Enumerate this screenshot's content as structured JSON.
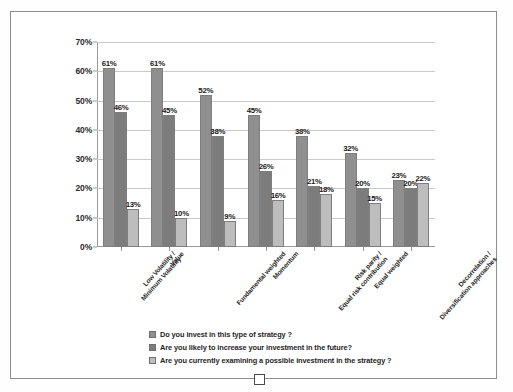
{
  "chart_data": {
    "type": "bar",
    "title": "",
    "xlabel": "",
    "ylabel": "",
    "ylim": [
      0,
      70
    ],
    "ytick_labels": [
      "0%",
      "10%",
      "20%",
      "30%",
      "40%",
      "50%",
      "60%",
      "70%"
    ],
    "ytick_values": [
      0,
      10,
      20,
      30,
      40,
      50,
      60,
      70
    ],
    "grid": true,
    "legend_position": "bottom",
    "value_suffix": "%",
    "categories": [
      "Low Volatility / Minimum Volatility",
      "Value",
      "Fundamental weighted",
      "Momentum",
      "Risk parity / Equal risk contribution",
      "Equal weighted",
      "Decorrelation / Diversification approaches"
    ],
    "category_lines": [
      [
        "Low Volatility /",
        "Minimum Volatility"
      ],
      [
        "Value"
      ],
      [
        "Fundamental weighted"
      ],
      [
        "Momentum"
      ],
      [
        "Risk parity /",
        "Equal risk contribution"
      ],
      [
        "Equal weighted"
      ],
      [
        "Decorrelation /",
        "Diversification approaches"
      ]
    ],
    "series": [
      {
        "name": "Do you invest in this type of strategy ?",
        "color": "#8f8f8f",
        "values": [
          61,
          61,
          52,
          45,
          38,
          32,
          23
        ],
        "labels": [
          "61%",
          "61%",
          "52%",
          "45%",
          "38%",
          "32%",
          "23%"
        ]
      },
      {
        "name": "Are you likely to increase your investment in the future?",
        "color": "#7c7c7c",
        "values": [
          46,
          45,
          38,
          26,
          21,
          20,
          20
        ],
        "labels": [
          "46%",
          "45%",
          "38%",
          "26%",
          "21%",
          "20%",
          "20%"
        ]
      },
      {
        "name": "Are you  currently examining a possible investment in the strategy ?",
        "color": "#bdbdbd",
        "values": [
          13,
          10,
          9,
          16,
          18,
          15,
          22
        ],
        "labels": [
          "13%",
          "10%",
          "9%",
          "16%",
          "18%",
          "15%",
          "22%"
        ]
      }
    ]
  },
  "legend": {
    "items": [
      "Do you invest in this type of strategy ?",
      "Are you likely to increase your investment in the future?",
      "Are you  currently examining a possible investment in the strategy ?"
    ]
  }
}
